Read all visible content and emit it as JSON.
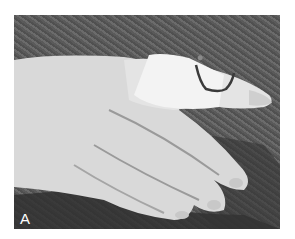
{
  "figure": {
    "panel_label": "A"
  }
}
